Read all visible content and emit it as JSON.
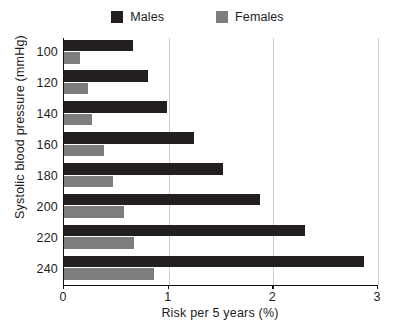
{
  "chart_data": {
    "type": "bar",
    "orientation": "horizontal",
    "title": "",
    "xlabel": "Risk per 5 years (%)",
    "ylabel": "Systolic blood pressure (mmHg)",
    "categories": [
      "100",
      "120",
      "140",
      "160",
      "180",
      "200",
      "220",
      "240"
    ],
    "xticks": [
      "0",
      "1",
      "2",
      "3"
    ],
    "xlim": [
      0,
      3
    ],
    "grid": true,
    "legend_position": "top-center",
    "series": [
      {
        "name": "Males",
        "color": "#231f20",
        "values": [
          0.66,
          0.8,
          0.98,
          1.24,
          1.52,
          1.87,
          2.3,
          2.87
        ]
      },
      {
        "name": "Females",
        "color": "#7d7d7d",
        "values": [
          0.15,
          0.23,
          0.27,
          0.38,
          0.47,
          0.57,
          0.67,
          0.86
        ]
      }
    ]
  },
  "legend": {
    "males_label": "Males",
    "females_label": "Females"
  },
  "axes": {
    "x_label": "Risk per 5 years (%)",
    "y_label": "Systolic blood pressure (mmHg)"
  }
}
